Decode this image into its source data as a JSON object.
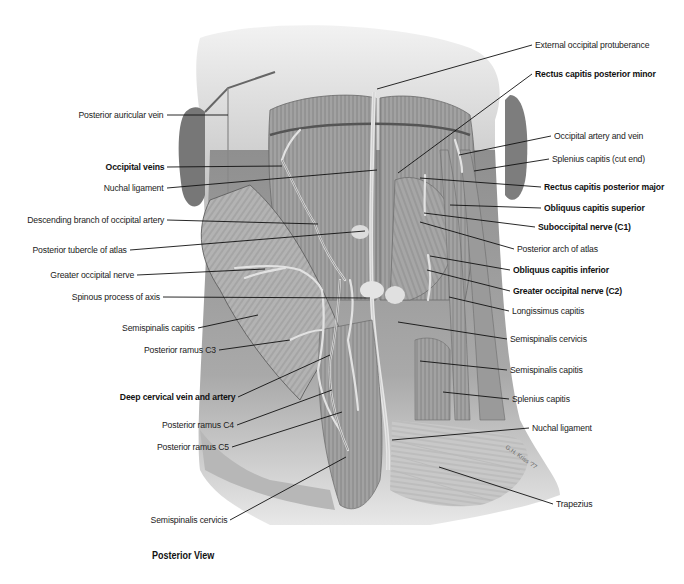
{
  "figure": {
    "caption": "Posterior View",
    "signature": "G.H. Kriss '77"
  },
  "labels_left": [
    {
      "id": "posterior-auricular-vein",
      "text": "Posterior auricular vein",
      "bold": false,
      "x": 167,
      "y": 115,
      "tx": 228,
      "ty": 115
    },
    {
      "id": "occipital-veins",
      "text": "Occipital veins",
      "bold": true,
      "x": 167,
      "y": 167,
      "tx": 282,
      "ty": 166
    },
    {
      "id": "nuchal-ligament-upper",
      "text": "Nuchal ligament",
      "bold": false,
      "x": 167,
      "y": 188,
      "tx": 377,
      "ty": 170
    },
    {
      "id": "descending-branch-occipital-artery",
      "text": "Descending branch of occipital artery",
      "bold": false,
      "x": 167,
      "y": 220,
      "tx": 318,
      "ty": 224
    },
    {
      "id": "posterior-tubercle-atlas",
      "text": "Posterior tubercle of atlas",
      "bold": false,
      "x": 130,
      "y": 250,
      "tx": 365,
      "ty": 231
    },
    {
      "id": "greater-occipital-nerve",
      "text": "Greater occipital nerve",
      "bold": false,
      "x": 137,
      "y": 275,
      "tx": 265,
      "ty": 269
    },
    {
      "id": "spinous-process-axis",
      "text": "Spinous process of axis",
      "bold": false,
      "x": 163,
      "y": 297,
      "tx": 370,
      "ty": 298
    },
    {
      "id": "semispinalis-capitis-left",
      "text": "Semispinalis capitis",
      "bold": false,
      "x": 198,
      "y": 328,
      "tx": 258,
      "ty": 315
    },
    {
      "id": "posterior-ramus-c3",
      "text": "Posterior ramus C3",
      "bold": false,
      "x": 219,
      "y": 350,
      "tx": 290,
      "ty": 340
    },
    {
      "id": "deep-cervical-vein-artery",
      "text": "Deep cervical vein and artery",
      "bold": true,
      "x": 238,
      "y": 397,
      "tx": 330,
      "ty": 355
    },
    {
      "id": "posterior-ramus-c4",
      "text": "Posterior ramus C4",
      "bold": false,
      "x": 237,
      "y": 425,
      "tx": 332,
      "ty": 390
    },
    {
      "id": "posterior-ramus-c5",
      "text": "Posterior ramus C5",
      "bold": false,
      "x": 232,
      "y": 447,
      "tx": 342,
      "ty": 412
    },
    {
      "id": "semispinalis-cervicis-left",
      "text": "Semispinalis cervicis",
      "bold": false,
      "x": 230,
      "y": 520,
      "tx": 346,
      "ty": 457
    }
  ],
  "labels_right": [
    {
      "id": "external-occipital-protuberance",
      "text": "External occipital protuberance",
      "bold": false,
      "x": 532,
      "y": 45,
      "tx": 377,
      "ty": 89
    },
    {
      "id": "rectus-capitis-posterior-minor",
      "text": "Rectus capitis posterior minor",
      "bold": true,
      "x": 532,
      "y": 74,
      "tx": 398,
      "ty": 173
    },
    {
      "id": "occipital-artery-vein",
      "text": "Occipital artery and vein",
      "bold": false,
      "x": 551,
      "y": 136,
      "tx": 459,
      "ty": 155
    },
    {
      "id": "splenius-capitis-cut-end",
      "text": "Splenius capitis (cut end)",
      "bold": false,
      "x": 549,
      "y": 159,
      "tx": 474,
      "ty": 171
    },
    {
      "id": "rectus-capitis-posterior-major",
      "text": "Rectus capitis posterior major",
      "bold": true,
      "x": 541,
      "y": 187,
      "tx": 420,
      "ty": 178
    },
    {
      "id": "obliquus-capitis-superior",
      "text": "Obliquus capitis superior",
      "bold": true,
      "x": 541,
      "y": 208,
      "tx": 450,
      "ty": 205
    },
    {
      "id": "suboccipital-nerve-c1",
      "text": "Suboccipital nerve (C1)",
      "bold": true,
      "x": 535,
      "y": 227,
      "tx": 424,
      "ty": 213
    },
    {
      "id": "posterior-arch-atlas",
      "text": "Posterior arch of atlas",
      "bold": false,
      "x": 514,
      "y": 249,
      "tx": 420,
      "ty": 222
    },
    {
      "id": "obliquus-capitis-inferior",
      "text": "Obliquus capitis inferior",
      "bold": true,
      "x": 510,
      "y": 270,
      "tx": 430,
      "ty": 256
    },
    {
      "id": "greater-occipital-nerve-c2",
      "text": "Greater occipital nerve (C2)",
      "bold": true,
      "x": 510,
      "y": 291,
      "tx": 427,
      "ty": 270
    },
    {
      "id": "longissimus-capitis",
      "text": "Longissimus capitis",
      "bold": false,
      "x": 509,
      "y": 311,
      "tx": 449,
      "ty": 297
    },
    {
      "id": "semispinalis-cervicis-right",
      "text": "Semispinalis cervicis",
      "bold": false,
      "x": 507,
      "y": 339,
      "tx": 398,
      "ty": 322
    },
    {
      "id": "semispinalis-capitis-right",
      "text": "Semispinalis capitis",
      "bold": false,
      "x": 507,
      "y": 370,
      "tx": 420,
      "ty": 361
    },
    {
      "id": "splenius-capitis",
      "text": "Splenius capitis",
      "bold": false,
      "x": 509,
      "y": 399,
      "tx": 443,
      "ty": 392
    },
    {
      "id": "nuchal-ligament-lower",
      "text": "Nuchal ligament",
      "bold": false,
      "x": 529,
      "y": 428,
      "tx": 392,
      "ty": 440
    },
    {
      "id": "trapezius",
      "text": "Trapezius",
      "bold": false,
      "x": 553,
      "y": 504,
      "tx": 439,
      "ty": 467
    }
  ]
}
